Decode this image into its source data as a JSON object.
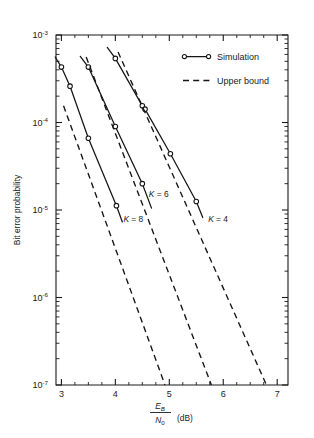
{
  "chart_data": {
    "type": "line",
    "title": "",
    "xlabel": "E_B/N_0 (dB)",
    "xlabel_parts": {
      "numerator": "E",
      "numerator_sub": "B",
      "denominator": "N",
      "denominator_sub": "0",
      "units": "(dB)"
    },
    "ylabel": "Bit error probability",
    "xlim": [
      2.9,
      7.2
    ],
    "ylim": [
      1e-07,
      0.001
    ],
    "yscale": "log",
    "xscale": "linear",
    "grid": false,
    "x_ticks_major": [
      3,
      4,
      5,
      6,
      7
    ],
    "x_tick_labels": [
      "3",
      "4",
      "5",
      "6",
      "7"
    ],
    "x_minor_step": 0.25,
    "y_ticks_major": [
      0.001,
      0.0001,
      1e-05,
      1e-06,
      1e-07
    ],
    "y_tick_labels": [
      {
        "base": "10",
        "exp": "-3"
      },
      {
        "base": "10",
        "exp": "-4"
      },
      {
        "base": "10",
        "exp": "-5"
      },
      {
        "base": "10",
        "exp": "-6"
      },
      {
        "base": "10",
        "exp": "-7"
      }
    ],
    "legend": {
      "position": "upper right",
      "entries": [
        {
          "label": "Simulation",
          "style": "solid-with-markers"
        },
        {
          "label": "Upper bound",
          "style": "dashed"
        }
      ]
    },
    "annotations": [
      {
        "text": "K = 8",
        "italic_prefix": "K",
        "rest": " = 8",
        "x": 4.15,
        "y": 7.2e-06
      },
      {
        "text": "K = 6",
        "italic_prefix": "K",
        "rest": " = 6",
        "x": 4.62,
        "y": 1.42e-05
      },
      {
        "text": "K = 4",
        "italic_prefix": "K",
        "rest": " = 4",
        "x": 5.72,
        "y": 7.2e-06
      }
    ],
    "series": [
      {
        "name": "Simulation K = 8",
        "style": "solid",
        "markers": true,
        "points": [
          {
            "x": 2.885,
            "y": 0.00056
          },
          {
            "x": 3.0,
            "y": 0.00043
          },
          {
            "x": 3.16,
            "y": 0.00026
          },
          {
            "x": 3.5,
            "y": 6.6e-05
          },
          {
            "x": 4.02,
            "y": 1.12e-05
          },
          {
            "x": 4.13,
            "y": 7.3e-06
          }
        ]
      },
      {
        "name": "Simulation K = 6",
        "style": "solid",
        "markers": true,
        "points": [
          {
            "x": 3.35,
            "y": 0.00057
          },
          {
            "x": 3.5,
            "y": 0.00043
          },
          {
            "x": 4.0,
            "y": 9e-05
          },
          {
            "x": 4.5,
            "y": 2e-05
          },
          {
            "x": 4.67,
            "y": 1.05e-05
          }
        ]
      },
      {
        "name": "Simulation K = 4",
        "style": "solid",
        "markers": true,
        "points": [
          {
            "x": 3.85,
            "y": 0.00072
          },
          {
            "x": 4.0,
            "y": 0.00054
          },
          {
            "x": 4.5,
            "y": 0.000155
          },
          {
            "x": 4.55,
            "y": 0.000142
          },
          {
            "x": 5.02,
            "y": 4.4e-05
          },
          {
            "x": 5.5,
            "y": 1.25e-05
          },
          {
            "x": 5.62,
            "y": 8.2e-06
          }
        ]
      },
      {
        "name": "Upper bound K = 8",
        "style": "dashed",
        "markers": false,
        "points": [
          {
            "x": 3.04,
            "y": 0.000155
          },
          {
            "x": 4.92,
            "y": 1e-07
          }
        ]
      },
      {
        "name": "Upper bound K = 6",
        "style": "dashed",
        "markers": false,
        "points": [
          {
            "x": 3.46,
            "y": 0.00056
          },
          {
            "x": 5.78,
            "y": 1e-07
          }
        ]
      },
      {
        "name": "Upper bound K = 4",
        "style": "dashed",
        "markers": false,
        "points": [
          {
            "x": 4.05,
            "y": 0.00064
          },
          {
            "x": 6.8,
            "y": 1e-07
          }
        ]
      }
    ]
  }
}
